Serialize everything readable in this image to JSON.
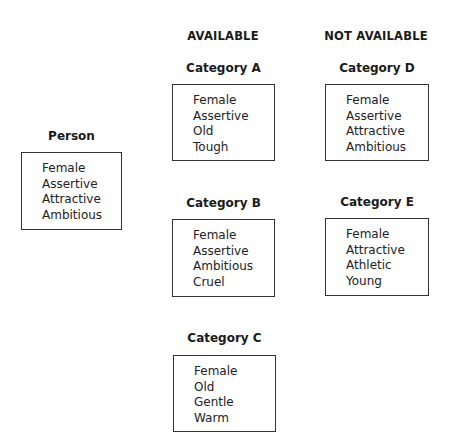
{
  "headers": {
    "available": "AVAILABLE",
    "not_available": "NOT AVAILABLE"
  },
  "person": {
    "label": "Person",
    "traits": [
      "Female",
      "Assertive",
      "Attractive",
      "Ambitious"
    ]
  },
  "categories": {
    "A": {
      "label": "Category A",
      "group": "AVAILABLE",
      "traits": [
        "Female",
        "Assertive",
        "Old",
        "Tough"
      ]
    },
    "B": {
      "label": "Category B",
      "group": "AVAILABLE",
      "traits": [
        "Female",
        "Assertive",
        "Ambitious",
        "Cruel"
      ]
    },
    "C": {
      "label": "Category C",
      "group": "AVAILABLE",
      "traits": [
        "Female",
        "Old",
        "Gentle",
        "Warm"
      ]
    },
    "D": {
      "label": "Category D",
      "group": "NOT AVAILABLE",
      "traits": [
        "Female",
        "Assertive",
        "Attractive",
        "Ambitious"
      ]
    },
    "E": {
      "label": "Category E",
      "group": "NOT AVAILABLE",
      "traits": [
        "Female",
        "Attractive",
        "Athletic",
        "Young"
      ]
    }
  },
  "colors": {
    "background": "#ffffff",
    "text": "#1a1a1a",
    "border": "#333333"
  }
}
